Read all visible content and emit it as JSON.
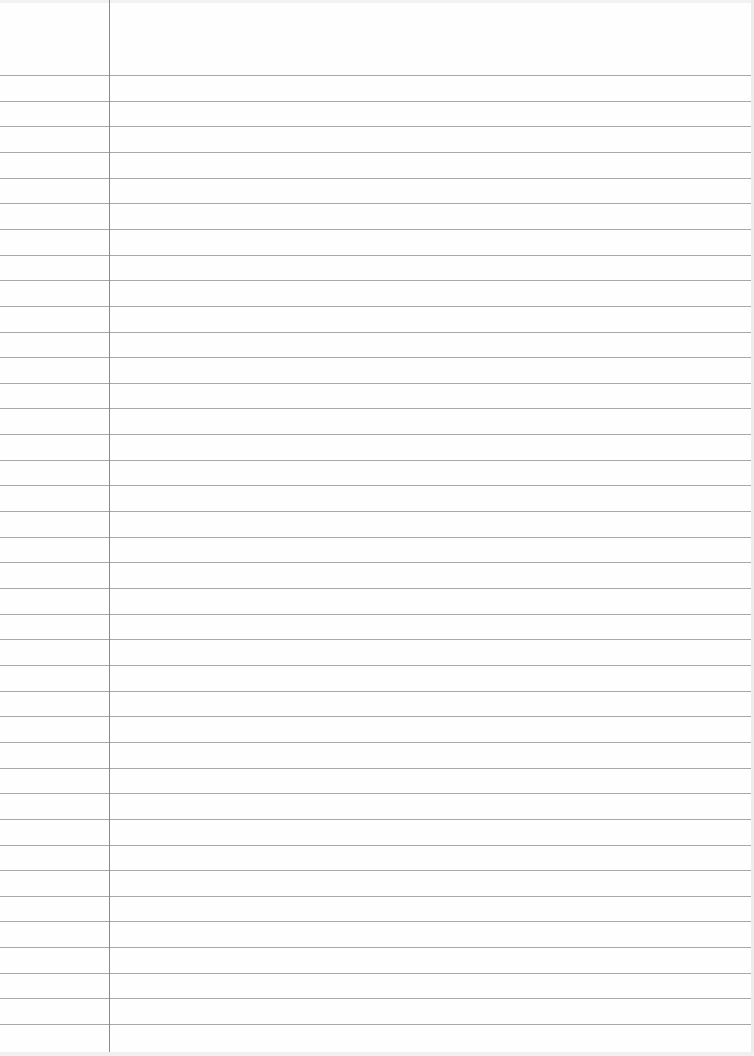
{
  "page": {
    "type": "ruled-paper",
    "background_color": "#fefefe",
    "rule_color": "#a8a8a8",
    "margin_color": "#8a8a8a",
    "first_rule_y": 75,
    "rule_spacing": 25.65,
    "rule_count": 38,
    "margin_x": 109
  }
}
